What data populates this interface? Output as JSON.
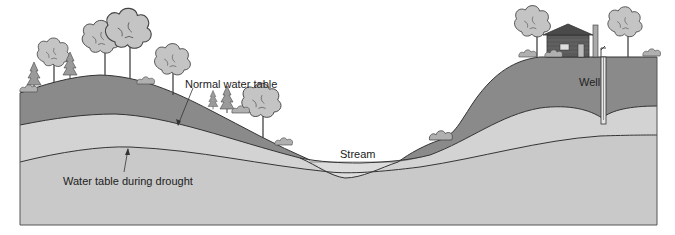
{
  "diagram": {
    "type": "cross-section",
    "labels": {
      "normal_water_table": "Normal water table",
      "drought_water_table": "Water table during drought",
      "stream": "Stream",
      "well": "Well"
    },
    "colors": {
      "unsaturated_zone": "#8a8a8a",
      "saturated_zone_upper": "#cfcfcf",
      "saturated_zone_lower": "#c9c9c9",
      "lines": "#333333",
      "tree_canopy": "#c4c4c4",
      "tree_outline": "#444444",
      "house": "#555555",
      "background": "#ffffff"
    },
    "features": [
      "trees",
      "conifers",
      "shrubs",
      "house",
      "chimney",
      "well",
      "stream"
    ]
  }
}
